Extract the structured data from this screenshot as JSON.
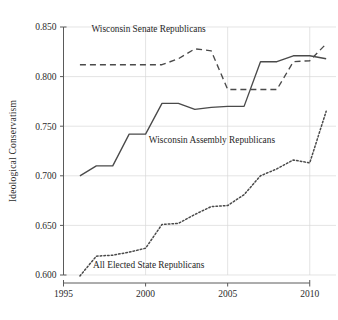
{
  "chart_data": {
    "type": "line",
    "title": "",
    "xlabel": "",
    "ylabel": "Ideological Conservatism",
    "xlim": [
      1995,
      2011.6
    ],
    "ylim": [
      0.6,
      0.85
    ],
    "xticks": [
      1995,
      2000,
      2005,
      2010
    ],
    "xticklabels": [
      "1995",
      "2000",
      "2005",
      "2010"
    ],
    "yticks": [
      0.6,
      0.65,
      0.7,
      0.75,
      0.8,
      0.85
    ],
    "yticklabels": [
      "0.600",
      "0.650",
      "0.700",
      "0.750",
      "0.800",
      "0.850"
    ],
    "grid": true,
    "grid_axis": "both",
    "legend": "inline-annotations",
    "x": [
      1996,
      1997,
      1998,
      1999,
      2000,
      2001,
      2002,
      2003,
      2004,
      2005,
      2006,
      2007,
      2008,
      2009,
      2010,
      2011
    ],
    "series": [
      {
        "name": "Wisconsin Senate Republicans",
        "style": "dashed",
        "values": [
          0.812,
          0.812,
          0.812,
          0.812,
          0.812,
          0.812,
          0.818,
          0.828,
          0.826,
          0.787,
          0.787,
          0.787,
          0.787,
          0.815,
          0.816,
          0.833
        ]
      },
      {
        "name": "Wisconsin Assembly Republicans",
        "style": "solid",
        "values": [
          0.7,
          0.71,
          0.71,
          0.742,
          0.742,
          0.773,
          0.773,
          0.767,
          0.769,
          0.77,
          0.77,
          0.815,
          0.815,
          0.821,
          0.821,
          0.818
        ]
      },
      {
        "name": "All Elected State Republicans",
        "style": "dotted",
        "values": [
          0.599,
          0.619,
          0.62,
          0.623,
          0.627,
          0.651,
          0.652,
          0.661,
          0.669,
          0.67,
          0.681,
          0.7,
          0.707,
          0.716,
          0.713,
          0.765
        ]
      }
    ],
    "annotations": [
      {
        "text": "Wisconsin Senate Republicans",
        "x": 1996.7,
        "y": 0.845,
        "anchor": "start"
      },
      {
        "text": "Wisconsin Assembly Republicans",
        "x": 2000.2,
        "y": 0.7335,
        "anchor": "start"
      },
      {
        "text": "All Elected State Republicans",
        "x": 1996.8,
        "y": 0.6075,
        "anchor": "start"
      }
    ]
  },
  "colors": {
    "background": "#ffffff",
    "line": "#4a4a4a",
    "grid": "#d8d8d8",
    "axis": "#5a5a5a",
    "text": "#2b2b2b"
  }
}
